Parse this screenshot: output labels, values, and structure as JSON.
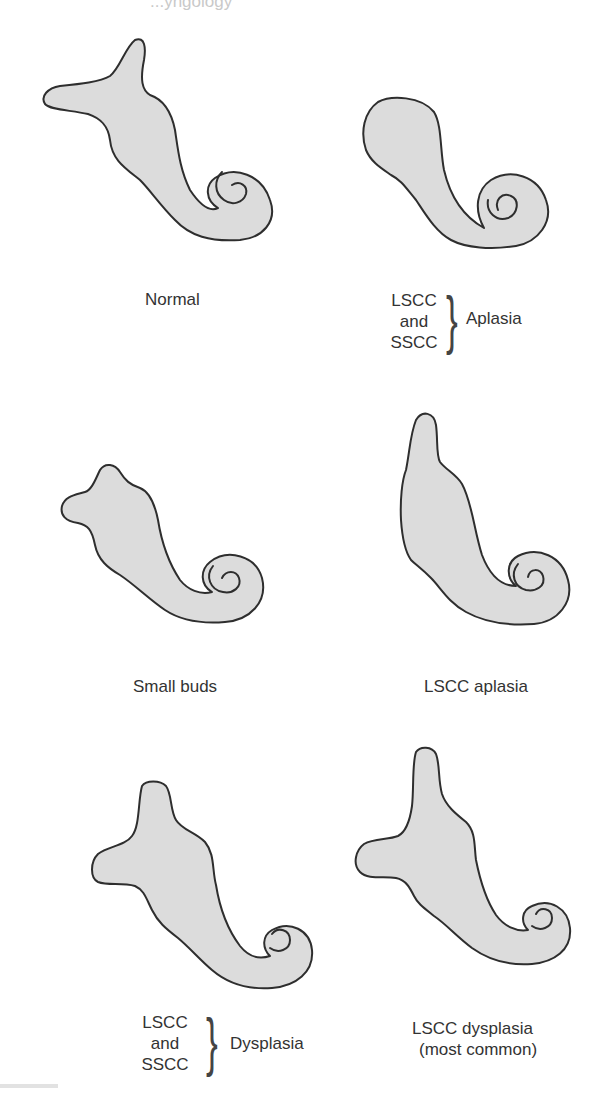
{
  "header": {
    "fragment": "...yngology"
  },
  "figure": {
    "panels": [
      {
        "id": "normal",
        "label": "Normal"
      },
      {
        "id": "lscc-sscc-aplasia",
        "stack": [
          "LSCC",
          "and",
          "SSCC"
        ],
        "group_label": "Aplasia"
      },
      {
        "id": "small-buds",
        "label": "Small buds"
      },
      {
        "id": "lscc-aplasia",
        "label": "LSCC aplasia"
      },
      {
        "id": "lscc-sscc-dysplasia",
        "stack": [
          "LSCC",
          "and",
          "SSCC"
        ],
        "group_label": "Dysplasia"
      },
      {
        "id": "lscc-dysplasia",
        "label_line1": "LSCC dysplasia",
        "label_line2": "(most common)"
      }
    ],
    "colors": {
      "fill": "#dcdcdc",
      "outline": "#2e2e2e",
      "text": "#333333"
    }
  }
}
